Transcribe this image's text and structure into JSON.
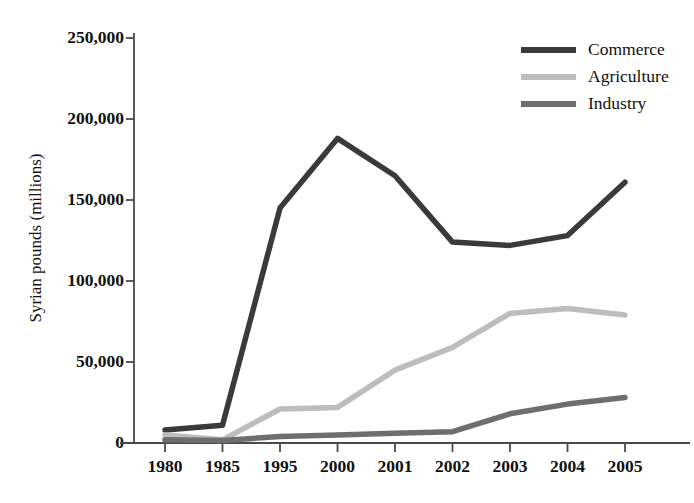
{
  "chart_data": {
    "type": "line",
    "title": "",
    "xlabel": "",
    "ylabel": "Syrian pounds (millions)",
    "categories": [
      "1980",
      "1985",
      "1995",
      "2000",
      "2001",
      "2002",
      "2003",
      "2004",
      "2005"
    ],
    "ylim": [
      0,
      250000
    ],
    "yticks": [
      0,
      50000,
      100000,
      150000,
      200000,
      250000
    ],
    "ytick_labels": [
      "0",
      "50,000",
      "100,000",
      "150,000",
      "200,000",
      "250,000"
    ],
    "grid": false,
    "legend_position": "top-right",
    "series": [
      {
        "name": "Commerce",
        "color": "#3a3a3a",
        "values": [
          8000,
          11000,
          145000,
          188000,
          165000,
          124000,
          122000,
          128000,
          161000
        ]
      },
      {
        "name": "Agriculture",
        "color": "#bdbdbd",
        "values": [
          5000,
          2000,
          21000,
          22000,
          45000,
          59000,
          80000,
          83000,
          79000
        ]
      },
      {
        "name": "Industry",
        "color": "#6e6e6e",
        "values": [
          2000,
          1500,
          4000,
          5000,
          6000,
          7000,
          18000,
          24000,
          28000
        ]
      }
    ]
  },
  "axis": {
    "y_title": "Syrian pounds (millions)"
  },
  "legend": {
    "items": [
      {
        "label": "Commerce",
        "color": "#3a3a3a"
      },
      {
        "label": "Agriculture",
        "color": "#bdbdbd"
      },
      {
        "label": "Industry",
        "color": "#6e6e6e"
      }
    ]
  }
}
